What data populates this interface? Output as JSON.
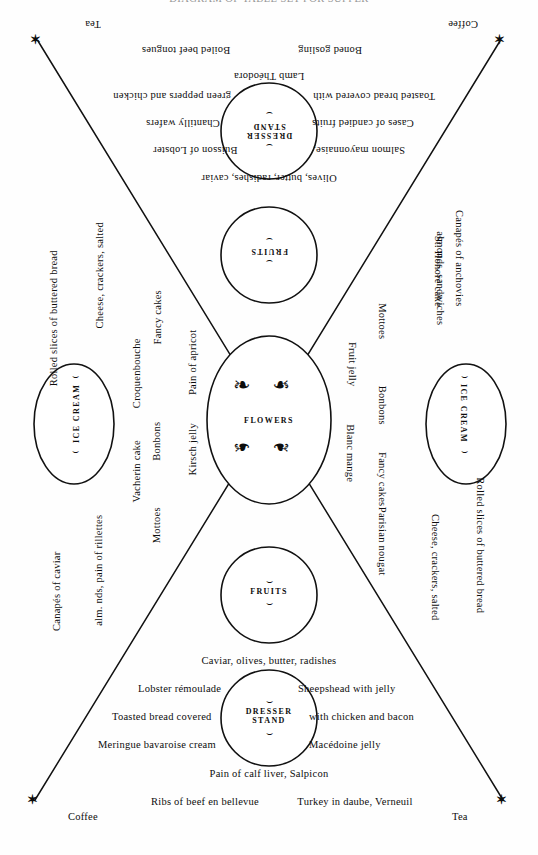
{
  "page": {
    "title_cropped": "DIAGRAM OF TABLE SET FOR SUPPER",
    "width": 538,
    "height": 855,
    "ink_color": "#0d0d0d",
    "paper_color": "#fefefe"
  },
  "corner_markers": {
    "glyph": "✶",
    "positions": [
      "top-left",
      "top-right",
      "bottom-left",
      "bottom-right"
    ]
  },
  "corner_labels": {
    "top_left": "Tea",
    "top_right": "Coffee",
    "bottom_left": "Coffee",
    "bottom_right": "Tea"
  },
  "stations": {
    "top_dresser": {
      "line1": "DRESSER",
      "line2": "STAND",
      "ornament": "⌣"
    },
    "top_fruits": {
      "label": "FRUITS",
      "ornament": "⌣"
    },
    "center_flowers": {
      "label": "FLOWERS",
      "ornament": "❧"
    },
    "bottom_fruits": {
      "label": "FRUITS",
      "ornament": "⌣"
    },
    "bottom_dresser": {
      "line1": "DRESSER",
      "line2": "STAND",
      "ornament": "⌣"
    },
    "left_ice_cream": {
      "label": "ICE CREAM",
      "ornament": "⌣"
    },
    "right_ice_cream": {
      "label": "ICE CREAM",
      "ornament": "⌣"
    }
  },
  "top_section": {
    "row_goose": "Boned gosling",
    "row_tongues": "Boiled beef tongues",
    "row_lamb": "Lamb Théodora",
    "toasted_left": "Toasted bread covered with",
    "toasted_right": "green peppers and chicken",
    "cases_left": "Cases of candied fruits",
    "chantilly_right": "Chantilly wafers",
    "salmon_left": "Salmon mayonnaise,",
    "buisson_right": "Buisson of Lobster",
    "olives_row": "Olives, butter, radishes, caviar"
  },
  "bottom_section": {
    "caviar_row": "Caviar, olives, butter,  radishes",
    "lobster_left": "Lobster rémoulade",
    "sheepshead_right": "Sheepshead with jelly",
    "toasted_left": "Toasted bread covered",
    "chicken_right": "with chicken and bacon",
    "meringue_left": "Meringue bavaroise cream",
    "macedoine_right": "Macédoine jelly",
    "pain_row": "Pain of calf liver, Salpicon",
    "ribs_left": "Ribs of beef en bellevue",
    "turkey_right": "Turkey in daube, Verneuil"
  },
  "left_columns": {
    "outer": {
      "bread": "Rolled slices of buttered bread",
      "cheese": "Cheese, crackers, salted",
      "almonds": "alm. nds, pain of rillettes",
      "canapes": "Canapés of caviar"
    },
    "middle": {
      "fancy_cakes": "Fancy cakes",
      "croquenbouche": "Croquenbouche",
      "bonbons": "Bonbons",
      "vacherin": "Vacherin cake",
      "mottoes": "Mottoes"
    },
    "inner": {
      "pain_apricot": "Pain of apricot",
      "kirsch": "Kirsch jelly"
    }
  },
  "right_columns": {
    "inner": {
      "fruit_jelly": "Fruit jelly",
      "blanc_mange": "Blanc mange"
    },
    "middle": {
      "mottoes": "Mottoes",
      "bonbons": "Bonbons",
      "fancy_cakes": "Fancy cakes",
      "parisian_nougat": "Parisian nougat"
    },
    "outer": {
      "st_honore": "St. Honoré cake",
      "almonds": "almonds, sandwiches",
      "canapes": "Canapés of anchovies",
      "cheese": "Cheese, crackers, salted",
      "bread": "Rolled slices of buttered bread"
    }
  }
}
